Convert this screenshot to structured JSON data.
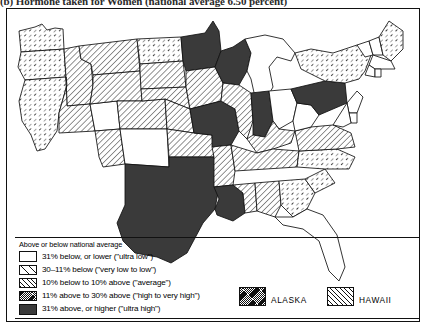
{
  "caption": {
    "text": "(b) Hormone taken for Women (national average 6.50 percent)"
  },
  "legend": {
    "title": "Above or below national average",
    "rows": [
      {
        "pattern": "ultralow",
        "label": "31% below, or lower (\"ultra low\")"
      },
      {
        "pattern": "verylow",
        "label": "30–11% below (\"very low to low\")"
      },
      {
        "pattern": "average",
        "label": "10% below to 10% above (\"average\")"
      },
      {
        "pattern": "high",
        "label": "11% above to 30% above (\"high to very high\")"
      },
      {
        "pattern": "ultrahigh",
        "label": "31% above, or higher (\"ultra high\")"
      }
    ],
    "insets": [
      {
        "name": "ALASKA",
        "pattern": "high"
      },
      {
        "name": "HAWAII",
        "pattern": "average"
      }
    ]
  },
  "map": {
    "title": "United States choropleth map",
    "states": [
      {
        "code": "WA",
        "pattern": "verylow"
      },
      {
        "code": "OR",
        "pattern": "verylow"
      },
      {
        "code": "CA",
        "pattern": "verylow"
      },
      {
        "code": "ID",
        "pattern": "average"
      },
      {
        "code": "NV",
        "pattern": "average"
      },
      {
        "code": "UT",
        "pattern": "ultralow"
      },
      {
        "code": "AZ",
        "pattern": "average"
      },
      {
        "code": "MT",
        "pattern": "average"
      },
      {
        "code": "WY",
        "pattern": "average"
      },
      {
        "code": "CO",
        "pattern": "average"
      },
      {
        "code": "NM",
        "pattern": "ultralow"
      },
      {
        "code": "ND",
        "pattern": "verylow"
      },
      {
        "code": "SD",
        "pattern": "average"
      },
      {
        "code": "NE",
        "pattern": "average"
      },
      {
        "code": "KS",
        "pattern": "average"
      },
      {
        "code": "OK",
        "pattern": "average"
      },
      {
        "code": "TX",
        "pattern": "ultrahigh"
      },
      {
        "code": "MN",
        "pattern": "ultrahigh"
      },
      {
        "code": "IA",
        "pattern": "average"
      },
      {
        "code": "MO",
        "pattern": "ultrahigh"
      },
      {
        "code": "AR",
        "pattern": "average"
      },
      {
        "code": "LA",
        "pattern": "ultrahigh"
      },
      {
        "code": "WI",
        "pattern": "ultrahigh"
      },
      {
        "code": "IL",
        "pattern": "average"
      },
      {
        "code": "MS",
        "pattern": "average"
      },
      {
        "code": "MI",
        "pattern": "ultralow"
      },
      {
        "code": "IN",
        "pattern": "ultrahigh"
      },
      {
        "code": "OH",
        "pattern": "ultralow"
      },
      {
        "code": "KY",
        "pattern": "average"
      },
      {
        "code": "TN",
        "pattern": "average"
      },
      {
        "code": "AL",
        "pattern": "average"
      },
      {
        "code": "GA",
        "pattern": "verylow"
      },
      {
        "code": "FL",
        "pattern": "ultralow"
      },
      {
        "code": "SC",
        "pattern": "verylow"
      },
      {
        "code": "NC",
        "pattern": "verylow"
      },
      {
        "code": "VA",
        "pattern": "average"
      },
      {
        "code": "WV",
        "pattern": "ultralow"
      },
      {
        "code": "PA",
        "pattern": "ultrahigh"
      },
      {
        "code": "NY",
        "pattern": "verylow"
      },
      {
        "code": "VT",
        "pattern": "ultralow"
      },
      {
        "code": "NH",
        "pattern": "ultralow"
      },
      {
        "code": "ME",
        "pattern": "verylow"
      },
      {
        "code": "MA",
        "pattern": "ultralow"
      },
      {
        "code": "CT",
        "pattern": "ultralow"
      },
      {
        "code": "RI",
        "pattern": "ultralow"
      },
      {
        "code": "NJ",
        "pattern": "ultralow"
      },
      {
        "code": "DE",
        "pattern": "ultralow"
      },
      {
        "code": "MD",
        "pattern": "ultralow"
      }
    ]
  }
}
